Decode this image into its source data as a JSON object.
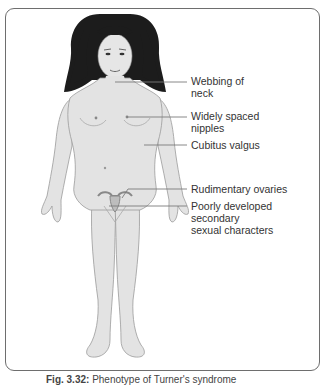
{
  "figure": {
    "colors": {
      "skin": "#e3e3e3",
      "skin_outline": "#9a9a9a",
      "hair": "#1c1c1c",
      "leader_line": "#7a7a7a",
      "frame_border": "#6e6e6e",
      "label_text": "#333333"
    }
  },
  "labels": [
    {
      "id": "webbing",
      "text": "Webbing of\nneck",
      "top": 75
    },
    {
      "id": "nipples",
      "text": "Widely spaced\nnipples",
      "top": 110
    },
    {
      "id": "cubitus",
      "text": "Cubitus valgus",
      "top": 139
    },
    {
      "id": "ovaries",
      "text": "Rudimentary ovaries",
      "top": 183
    },
    {
      "id": "secondary",
      "text": "Poorly developed\nsecondary\nsexual characters",
      "top": 200
    }
  ],
  "caption": {
    "prefix": "Fig. 3.32:",
    "text": "Phenotype of Turner's syndrome"
  }
}
